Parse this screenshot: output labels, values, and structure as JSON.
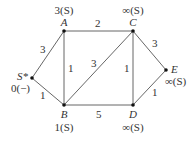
{
  "graph": {
    "nodes": [
      {
        "id": "S",
        "label": "S*",
        "value": "0(−)",
        "x": 32,
        "y": 78
      },
      {
        "id": "A",
        "label": "A",
        "value": "3(S)",
        "x": 64,
        "y": 31
      },
      {
        "id": "C",
        "label": "C",
        "value": "∞(S)",
        "x": 133,
        "y": 31
      },
      {
        "id": "B",
        "label": "B",
        "value": "1(S)",
        "x": 64,
        "y": 105
      },
      {
        "id": "D",
        "label": "D",
        "value": "∞(S)",
        "x": 133,
        "y": 105
      },
      {
        "id": "E",
        "label": "E",
        "value": "∞(S)",
        "x": 166,
        "y": 70
      }
    ],
    "edges": [
      {
        "from": "S",
        "to": "A",
        "weight": "3"
      },
      {
        "from": "S",
        "to": "B",
        "weight": "1"
      },
      {
        "from": "A",
        "to": "C",
        "weight": "2"
      },
      {
        "from": "A",
        "to": "B",
        "weight": "1"
      },
      {
        "from": "B",
        "to": "C",
        "weight": "3"
      },
      {
        "from": "C",
        "to": "D",
        "weight": "1"
      },
      {
        "from": "C",
        "to": "E",
        "weight": "3"
      },
      {
        "from": "B",
        "to": "D",
        "weight": "5"
      },
      {
        "from": "D",
        "to": "E",
        "weight": "1"
      }
    ]
  }
}
